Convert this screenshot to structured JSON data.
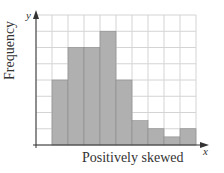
{
  "chart_data": {
    "type": "bar",
    "title": "",
    "xlabel": "Positively skewed",
    "ylabel": "Frequency",
    "x_axis_letter": "x",
    "y_axis_letter": "y",
    "categories": [
      "1",
      "2",
      "3",
      "4",
      "5",
      "6",
      "7",
      "8",
      "9"
    ],
    "values": [
      4,
      6,
      6,
      7,
      4,
      1.5,
      1,
      0.5,
      1
    ],
    "grid": true,
    "grid_columns": 10,
    "grid_rows": 8,
    "ylim": [
      0,
      8
    ],
    "bar_start_column": 1,
    "tick_labels": "none",
    "colors": {
      "bar": "#b0b0b0",
      "bar_edge": "#8a8a8a",
      "grid": "#d4d4d4",
      "axis": "#333333"
    }
  }
}
